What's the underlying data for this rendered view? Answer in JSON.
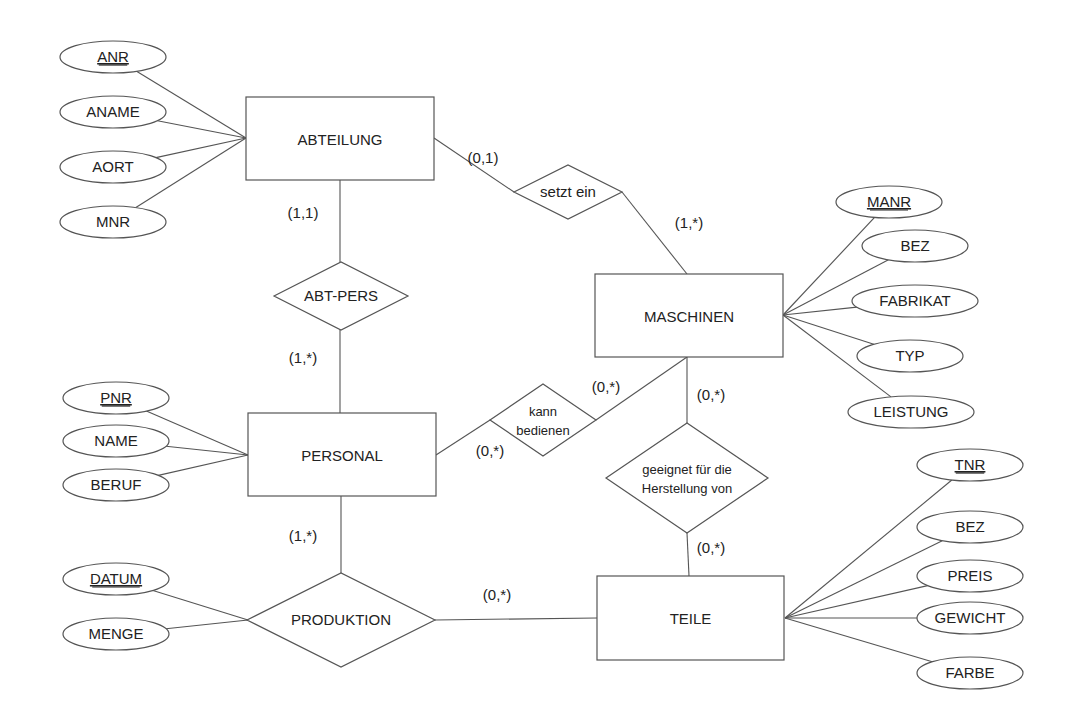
{
  "diagram": {
    "type": "entity-relationship",
    "colors": {
      "stroke": "#555555",
      "text": "#222222",
      "background": "#ffffff"
    },
    "entities": [
      {
        "id": "abteilung",
        "label": "ABTEILUNG",
        "x": 246,
        "y": 97,
        "w": 188,
        "h": 83
      },
      {
        "id": "maschinen",
        "label": "MASCHINEN",
        "x": 595,
        "y": 274,
        "w": 188,
        "h": 83
      },
      {
        "id": "personal",
        "label": "PERSONAL",
        "x": 248,
        "y": 413,
        "w": 188,
        "h": 83
      },
      {
        "id": "teile",
        "label": "TEILE",
        "x": 597,
        "y": 576,
        "w": 187,
        "h": 84
      }
    ],
    "relationships": [
      {
        "id": "setzt-ein",
        "lines": [
          "setzt ein"
        ],
        "cx": 568,
        "cy": 192,
        "hw": 54,
        "hh": 27
      },
      {
        "id": "abt-pers",
        "lines": [
          "ABT-PERS"
        ],
        "cx": 341,
        "cy": 296,
        "hw": 67,
        "hh": 34
      },
      {
        "id": "kann-bedienen",
        "lines": [
          "kann",
          "bedienen"
        ],
        "cx": 543,
        "cy": 420,
        "hw": 53,
        "hh": 36
      },
      {
        "id": "geeignet",
        "lines": [
          "geeignet für die",
          "Herstellung von"
        ],
        "cx": 687,
        "cy": 478,
        "hw": 81,
        "hh": 55
      },
      {
        "id": "produktion",
        "lines": [
          "PRODUKTION"
        ],
        "cx": 341,
        "cy": 620,
        "hw": 94,
        "hh": 47
      }
    ],
    "attributes": [
      {
        "entity": "ABTEILUNG",
        "label": "ANR",
        "key": true,
        "cx": 113,
        "cy": 57,
        "rx": 53,
        "ry": 16,
        "ax": 246,
        "ay": 138
      },
      {
        "entity": "ABTEILUNG",
        "label": "ANAME",
        "key": false,
        "cx": 113,
        "cy": 112,
        "rx": 53,
        "ry": 16,
        "ax": 246,
        "ay": 138
      },
      {
        "entity": "ABTEILUNG",
        "label": "AORT",
        "key": false,
        "cx": 113,
        "cy": 167,
        "rx": 53,
        "ry": 16,
        "ax": 246,
        "ay": 138
      },
      {
        "entity": "ABTEILUNG",
        "label": "MNR",
        "key": false,
        "cx": 113,
        "cy": 222,
        "rx": 53,
        "ry": 16,
        "ax": 246,
        "ay": 138
      },
      {
        "entity": "MASCHINEN",
        "label": "MANR",
        "key": true,
        "cx": 889,
        "cy": 202,
        "rx": 53,
        "ry": 16,
        "ax": 783,
        "ay": 315
      },
      {
        "entity": "MASCHINEN",
        "label": "BEZ",
        "key": false,
        "cx": 915,
        "cy": 246,
        "rx": 53,
        "ry": 16,
        "ax": 783,
        "ay": 315
      },
      {
        "entity": "MASCHINEN",
        "label": "FABRIKAT",
        "key": false,
        "cx": 915,
        "cy": 301,
        "rx": 63,
        "ry": 16,
        "ax": 783,
        "ay": 315
      },
      {
        "entity": "MASCHINEN",
        "label": "TYP",
        "key": false,
        "cx": 910,
        "cy": 356,
        "rx": 53,
        "ry": 16,
        "ax": 783,
        "ay": 315
      },
      {
        "entity": "MASCHINEN",
        "label": "LEISTUNG",
        "key": false,
        "cx": 911,
        "cy": 412,
        "rx": 63,
        "ry": 16,
        "ax": 783,
        "ay": 315
      },
      {
        "entity": "PERSONAL",
        "label": "PNR",
        "key": true,
        "cx": 116,
        "cy": 398,
        "rx": 53,
        "ry": 16,
        "ax": 248,
        "ay": 455
      },
      {
        "entity": "PERSONAL",
        "label": "NAME",
        "key": false,
        "cx": 116,
        "cy": 441,
        "rx": 53,
        "ry": 16,
        "ax": 248,
        "ay": 455
      },
      {
        "entity": "PERSONAL",
        "label": "BERUF",
        "key": false,
        "cx": 116,
        "cy": 485,
        "rx": 53,
        "ry": 16,
        "ax": 248,
        "ay": 455
      },
      {
        "entity": "PRODUKTION",
        "label": "DATUM",
        "key": true,
        "cx": 116,
        "cy": 579,
        "rx": 53,
        "ry": 16,
        "ax": 248,
        "ay": 620
      },
      {
        "entity": "PRODUKTION",
        "label": "MENGE",
        "key": false,
        "cx": 116,
        "cy": 634,
        "rx": 53,
        "ry": 16,
        "ax": 248,
        "ay": 620
      },
      {
        "entity": "TEILE",
        "label": "TNR",
        "key": true,
        "cx": 970,
        "cy": 465,
        "rx": 53,
        "ry": 16,
        "ax": 785,
        "ay": 618
      },
      {
        "entity": "TEILE",
        "label": "BEZ",
        "key": false,
        "cx": 970,
        "cy": 527,
        "rx": 53,
        "ry": 16,
        "ax": 785,
        "ay": 618
      },
      {
        "entity": "TEILE",
        "label": "PREIS",
        "key": false,
        "cx": 970,
        "cy": 576,
        "rx": 53,
        "ry": 16,
        "ax": 785,
        "ay": 618
      },
      {
        "entity": "TEILE",
        "label": "GEWICHT",
        "key": false,
        "cx": 970,
        "cy": 618,
        "rx": 53,
        "ry": 16,
        "ax": 785,
        "ay": 618
      },
      {
        "entity": "TEILE",
        "label": "FARBE",
        "key": false,
        "cx": 970,
        "cy": 673,
        "rx": 53,
        "ry": 16,
        "ax": 785,
        "ay": 618
      }
    ],
    "connections": [
      {
        "from": "ABTEILUNG",
        "to": "setzt ein",
        "x1": 434,
        "y1": 138,
        "x2": 514,
        "y2": 192
      },
      {
        "from": "setzt ein",
        "to": "MASCHINEN",
        "x1": 622,
        "y1": 192,
        "x2": 687,
        "y2": 274
      },
      {
        "from": "ABTEILUNG",
        "to": "ABT-PERS",
        "x1": 340,
        "y1": 180,
        "x2": 340,
        "y2": 262
      },
      {
        "from": "ABT-PERS",
        "to": "PERSONAL",
        "x1": 340,
        "y1": 330,
        "x2": 340,
        "y2": 413
      },
      {
        "from": "PERSONAL",
        "to": "kann bedienen",
        "x1": 436,
        "y1": 455,
        "x2": 490,
        "y2": 420
      },
      {
        "from": "kann bedienen",
        "to": "MASCHINEN",
        "x1": 596,
        "y1": 420,
        "x2": 687,
        "y2": 357
      },
      {
        "from": "MASCHINEN",
        "to": "geeignet",
        "x1": 687,
        "y1": 357,
        "x2": 687,
        "y2": 423
      },
      {
        "from": "geeignet",
        "to": "TEILE",
        "x1": 687,
        "y1": 533,
        "x2": 689,
        "y2": 576
      },
      {
        "from": "PERSONAL",
        "to": "PRODUKTION",
        "x1": 341,
        "y1": 496,
        "x2": 341,
        "y2": 573
      },
      {
        "from": "PRODUKTION",
        "to": "TEILE",
        "x1": 435,
        "y1": 620,
        "x2": 597,
        "y2": 618
      }
    ],
    "cardinalities": [
      {
        "label": "(0,1)",
        "x": 483,
        "y": 163
      },
      {
        "label": "(1,*)",
        "x": 689,
        "y": 228
      },
      {
        "label": "(1,1)",
        "x": 303,
        "y": 218
      },
      {
        "label": "(1,*)",
        "x": 303,
        "y": 363
      },
      {
        "label": "(0,*)",
        "x": 606,
        "y": 392
      },
      {
        "label": "(0,*)",
        "x": 711,
        "y": 400
      },
      {
        "label": "(0,*)",
        "x": 490,
        "y": 456
      },
      {
        "label": "(0,*)",
        "x": 711,
        "y": 553
      },
      {
        "label": "(1,*)",
        "x": 303,
        "y": 541
      },
      {
        "label": "(0,*)",
        "x": 497,
        "y": 600
      }
    ]
  }
}
